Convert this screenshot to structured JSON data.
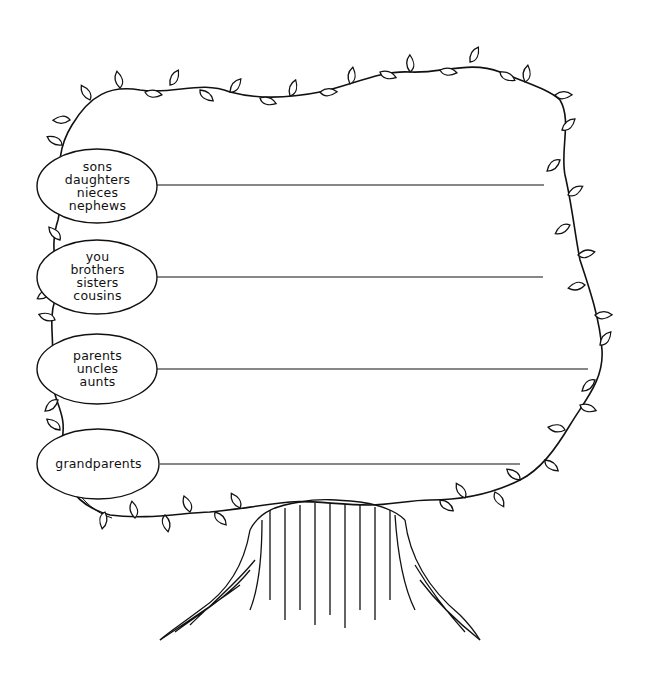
{
  "generations": [
    {
      "id": "children",
      "lines": [
        "sons",
        "daughters",
        "nieces",
        "nephews"
      ],
      "line_y": 185,
      "line_end_x": 544
    },
    {
      "id": "self",
      "lines": [
        "you",
        "brothers",
        "sisters",
        "cousins"
      ],
      "line_y": 277,
      "line_end_x": 543
    },
    {
      "id": "parents",
      "lines": [
        "parents",
        "uncles",
        "aunts"
      ],
      "line_y": 369,
      "line_end_x": 588
    },
    {
      "id": "grandparents",
      "lines": [
        "grandparents"
      ],
      "line_y": 464,
      "line_end_x": 520
    }
  ],
  "colors": {
    "ink": "#111111",
    "paper": "#ffffff"
  }
}
